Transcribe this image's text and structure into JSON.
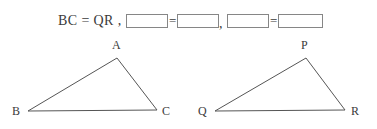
{
  "worksheet": {
    "equation": {
      "prefix": "BC = QR ,",
      "separator": ",",
      "blank_groups": [
        {
          "left_blank": "",
          "operator": "=",
          "right_blank": ""
        },
        {
          "left_blank": "",
          "operator": "=",
          "right_blank": ""
        }
      ]
    },
    "figures": [
      {
        "name": "triangle-abc",
        "vertices": [
          {
            "label": "A",
            "x": 117,
            "y": 22,
            "label_x": 112,
            "label_y": 13
          },
          {
            "label": "B",
            "x": 28,
            "y": 75,
            "label_x": 12,
            "label_y": 79
          },
          {
            "label": "C",
            "x": 157,
            "y": 74,
            "label_x": 162,
            "label_y": 79
          }
        ]
      },
      {
        "name": "triangle-pqr",
        "vertices": [
          {
            "label": "P",
            "x": 118,
            "y": 22,
            "label_x": 113,
            "label_y": 13
          },
          {
            "label": "Q",
            "x": 27,
            "y": 75,
            "label_x": 10,
            "label_y": 79
          },
          {
            "label": "R",
            "x": 157,
            "y": 74,
            "label_x": 163,
            "label_y": 79
          }
        ]
      }
    ]
  },
  "colors": {
    "background": "#ffffff",
    "ink": "#3b3b3b",
    "line": "#555555",
    "box_border": "#868686"
  }
}
